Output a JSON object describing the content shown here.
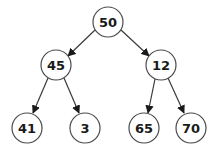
{
  "diagram": {
    "type": "binary-tree",
    "colors": {
      "node_stroke": "#4a4a4a",
      "edge": "#3a3a3a",
      "text": "#1a1a1a",
      "background": "#ffffff"
    },
    "nodes": [
      {
        "id": "n50",
        "label": "50",
        "x": 108,
        "y": 22
      },
      {
        "id": "n45",
        "label": "45",
        "x": 56,
        "y": 65
      },
      {
        "id": "n12",
        "label": "12",
        "x": 161,
        "y": 65
      },
      {
        "id": "n41",
        "label": "41",
        "x": 27,
        "y": 128
      },
      {
        "id": "n3",
        "label": "3",
        "x": 85,
        "y": 128
      },
      {
        "id": "n65",
        "label": "65",
        "x": 144,
        "y": 128
      },
      {
        "id": "n70",
        "label": "70",
        "x": 191,
        "y": 128
      }
    ],
    "edges": [
      {
        "from": "n50",
        "to": "n45"
      },
      {
        "from": "n50",
        "to": "n12"
      },
      {
        "from": "n45",
        "to": "n41"
      },
      {
        "from": "n45",
        "to": "n3"
      },
      {
        "from": "n12",
        "to": "n65"
      },
      {
        "from": "n12",
        "to": "n70"
      }
    ]
  }
}
